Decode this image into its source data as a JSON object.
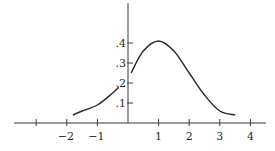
{
  "chart_data": {
    "type": "line",
    "title": "",
    "xlabel": "",
    "ylabel": "",
    "x_ticks": [
      -3,
      -2,
      -1,
      0,
      1,
      2,
      3,
      4
    ],
    "x_tick_labels": [
      "",
      "−2",
      "−1",
      "",
      "1",
      "2",
      "3",
      "4"
    ],
    "y_ticks": [
      0.1,
      0.2,
      0.3,
      0.4
    ],
    "y_tick_labels": [
      ".1",
      ".2",
      ".3",
      ".4"
    ],
    "xlim": [
      -3.7,
      4.5
    ],
    "ylim": [
      0,
      0.6
    ],
    "grid": false,
    "legend": null,
    "series": [
      {
        "name": "density",
        "description": "Bell-shaped (normal-like) curve centered at x = 1 with peak ≈ 0.41",
        "x": [
          -1.8,
          -1.5,
          -1.0,
          -0.5,
          -0.3,
          0.1,
          0.5,
          1.0,
          1.5,
          2.0,
          2.5,
          3.0,
          3.5
        ],
        "y": [
          0.04,
          0.06,
          0.09,
          0.15,
          0.18,
          0.25,
          0.36,
          0.41,
          0.36,
          0.25,
          0.14,
          0.06,
          0.04
        ]
      }
    ]
  }
}
